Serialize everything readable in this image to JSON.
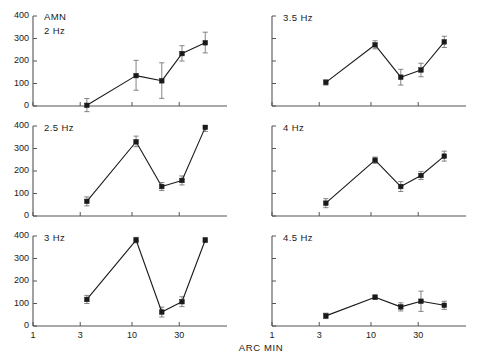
{
  "figure": {
    "group_label": "AMN",
    "xlabel": "ARC MIN",
    "y_ticks": [
      "0",
      "100",
      "200",
      "300",
      "400"
    ],
    "x_ticks": [
      "1",
      "3",
      "10",
      "30"
    ]
  },
  "chart_data": {
    "type": "line",
    "title": "AMN",
    "xlabel": "ARC MIN",
    "ylabel": "",
    "xscale": "log",
    "xlim": [
      1,
      60
    ],
    "ylim": [
      0,
      400
    ],
    "x_tick_values": [
      1,
      3,
      10,
      30
    ],
    "y_tick_values": [
      0,
      100,
      200,
      300,
      400
    ],
    "grid": false,
    "legend": "none",
    "marker": "filled-square",
    "errorbars": true,
    "panel_layout": {
      "rows": 3,
      "cols": 2,
      "order": "column-major"
    },
    "panels": [
      {
        "label": "2 Hz",
        "row": 0,
        "col": 0,
        "x": [
          3.5,
          11,
          20,
          32,
          55
        ],
        "values": [
          3,
          135,
          112,
          233,
          281
        ],
        "err_low": [
          28,
          65,
          78,
          33,
          45
        ],
        "err_high": [
          30,
          68,
          80,
          35,
          47
        ]
      },
      {
        "label": "2.5 Hz",
        "row": 1,
        "col": 0,
        "x": [
          3.5,
          11,
          20,
          32,
          55
        ],
        "values": [
          65,
          330,
          131,
          158,
          394
        ],
        "err_low": [
          20,
          22,
          18,
          20,
          18
        ],
        "err_high": [
          20,
          25,
          18,
          20,
          18
        ]
      },
      {
        "label": "3 Hz",
        "row": 2,
        "col": 0,
        "x": [
          3.5,
          11,
          20,
          32,
          55
        ],
        "values": [
          118,
          382,
          62,
          108,
          382
        ],
        "err_low": [
          18,
          12,
          22,
          22,
          10
        ],
        "err_high": [
          18,
          12,
          22,
          22,
          10
        ]
      },
      {
        "label": "3.5 Hz",
        "row": 0,
        "col": 1,
        "x": [
          3.5,
          11,
          20,
          32,
          55
        ],
        "values": [
          105,
          272,
          128,
          160,
          285
        ],
        "err_low": [
          12,
          18,
          35,
          30,
          25
        ],
        "err_high": [
          12,
          18,
          35,
          30,
          25
        ]
      },
      {
        "label": "4 Hz",
        "row": 1,
        "col": 1,
        "x": [
          3.5,
          11,
          20,
          32,
          55
        ],
        "values": [
          57,
          248,
          131,
          180,
          266
        ],
        "err_low": [
          20,
          14,
          22,
          18,
          22
        ],
        "err_high": [
          20,
          14,
          22,
          18,
          22
        ]
      },
      {
        "label": "4.5 Hz",
        "row": 2,
        "col": 1,
        "x": [
          3.5,
          11,
          20,
          32,
          55
        ],
        "values": [
          45,
          128,
          85,
          110,
          92
        ],
        "err_low": [
          12,
          10,
          18,
          45,
          18
        ],
        "err_high": [
          12,
          10,
          18,
          45,
          18
        ]
      }
    ]
  },
  "style": {
    "line_color": "#1a1a1a",
    "marker_color": "#1a1a1a",
    "axis_color": "#555555",
    "errorbar_color": "#777777",
    "background": "#ffffff"
  }
}
